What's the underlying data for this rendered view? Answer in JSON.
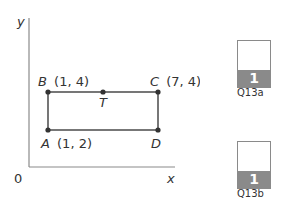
{
  "diagram": {
    "axis_labels": {
      "y": "y",
      "x": "x",
      "origin": "0"
    },
    "points": {
      "A": {
        "name": "A",
        "coords": "(1, 2)"
      },
      "B": {
        "name": "B",
        "coords": "(1, 4)"
      },
      "C": {
        "name": "C",
        "coords": "(7, 4)"
      },
      "D": {
        "name": "D",
        "coords": ""
      },
      "T": {
        "name": "T",
        "coords": ""
      }
    },
    "colors": {
      "line": "#555555",
      "point": "#333333",
      "axis": "#8a8a8a"
    }
  },
  "marks": [
    {
      "value": "1",
      "label": "Q13a"
    },
    {
      "value": "1",
      "label": "Q13b"
    }
  ]
}
